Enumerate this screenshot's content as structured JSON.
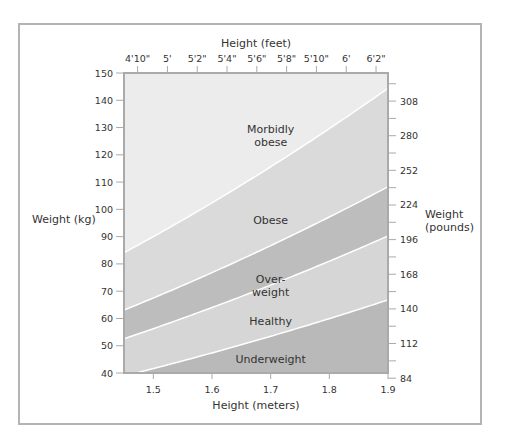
{
  "chart_data": {
    "type": "area",
    "title": "",
    "xlabel": "Height (meters)",
    "ylabel": "Weight (kg)",
    "x2label": "Height (feet)",
    "y2label": [
      "Weight",
      "(pounds)"
    ],
    "xlim": [
      1.45,
      1.9
    ],
    "ylim": [
      40,
      150
    ],
    "x_ticks": [
      1.5,
      1.6,
      1.7,
      1.8,
      1.9
    ],
    "x_tick_labels": [
      "1.5",
      "1.6",
      "1.7",
      "1.8",
      "1.9"
    ],
    "y_ticks": [
      40,
      50,
      60,
      70,
      80,
      90,
      100,
      110,
      120,
      130,
      140,
      150
    ],
    "y_tick_labels": [
      "40",
      "50",
      "60",
      "70",
      "80",
      "90",
      "100",
      "110",
      "120",
      "130",
      "140",
      "150"
    ],
    "x2_tick_labels": [
      "4'10\"",
      "5'",
      "5'2\"",
      "5'4\"",
      "5'6\"",
      "5'8\"",
      "5'10\"",
      "6'",
      "6'2\""
    ],
    "x2_tick_inches": [
      58,
      60,
      62,
      64,
      66,
      68,
      70,
      72,
      74
    ],
    "y2_tick_labels": [
      "84",
      "112",
      "140",
      "168",
      "196",
      "224",
      "252",
      "280",
      "308"
    ],
    "y2_tick_pounds": [
      84,
      112,
      140,
      168,
      196,
      224,
      252,
      280,
      308
    ],
    "grid": false,
    "series": [
      {
        "name": "Underweight",
        "bmi_upper": 18.5,
        "color": "#b9b9b9",
        "label_pos": [
          1.7,
          45
        ]
      },
      {
        "name": "Healthy",
        "bmi_upper": 25,
        "color": "#d6d6d6",
        "label_pos": [
          1.7,
          59
        ]
      },
      {
        "name": "Over-weight",
        "label_lines": [
          "Over-",
          "weight"
        ],
        "bmi_upper": 30,
        "color": "#bdbdbd",
        "label_pos": [
          1.7,
          72
        ]
      },
      {
        "name": "Obese",
        "bmi_upper": 40,
        "color": "#dadada",
        "label_pos": [
          1.7,
          96
        ]
      },
      {
        "name": "Morbidly obese",
        "label_lines": [
          "Morbidly",
          "obese"
        ],
        "bmi_upper": null,
        "color": "#ececec",
        "label_pos": [
          1.7,
          127
        ]
      }
    ],
    "boundaries_kg": {
      "x": [
        1.45,
        1.5,
        1.6,
        1.7,
        1.8,
        1.9
      ],
      "bmi_18_5": [
        38.9,
        41.6,
        47.4,
        53.5,
        59.9,
        66.8
      ],
      "bmi_25": [
        52.6,
        56.3,
        64.0,
        72.3,
        81.0,
        90.3
      ],
      "bmi_30": [
        63.1,
        67.5,
        76.8,
        86.7,
        97.2,
        108.3
      ],
      "bmi_40": [
        84.1,
        90.0,
        102.4,
        115.6,
        129.6,
        144.4
      ]
    }
  }
}
